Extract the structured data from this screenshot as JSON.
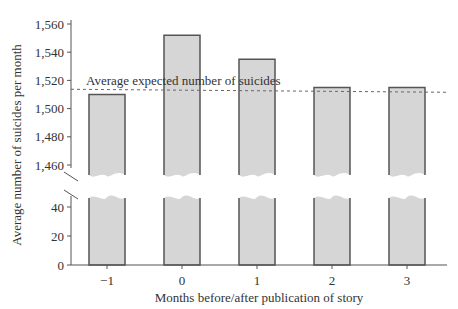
{
  "chart_data": {
    "type": "bar",
    "title": "",
    "xlabel": "Months before/after publication of story",
    "ylabel": "Average number of suicides per month",
    "categories": [
      "−1",
      "0",
      "1",
      "2",
      "3"
    ],
    "values": [
      1510,
      1552,
      1535,
      1515,
      1515
    ],
    "reference_line": {
      "label": "Average expected number of suicides",
      "value": 1513,
      "style": "dashed"
    },
    "y_axis": {
      "broken": true,
      "upper_segment": {
        "range": [
          1460,
          1560
        ],
        "ticks": [
          "1,460",
          "1,480",
          "1,500",
          "1,520",
          "1,540",
          "1,560"
        ]
      },
      "lower_segment": {
        "range": [
          0,
          40
        ],
        "ticks": [
          "0",
          "20",
          "40"
        ]
      }
    },
    "grid": false,
    "legend": null,
    "colors": {
      "bar_fill": "#d6d6d6",
      "bar_stroke": "#555555",
      "axis": "#555555",
      "ref_line": "#666666"
    }
  }
}
